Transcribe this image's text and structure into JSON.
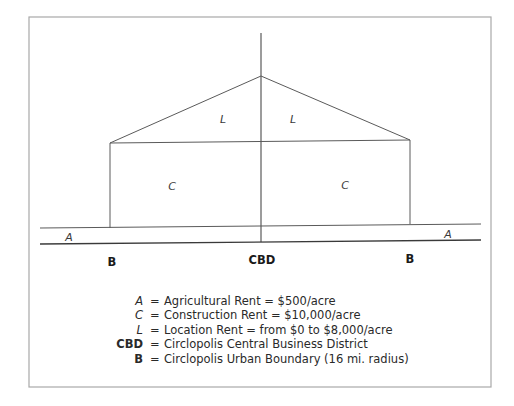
{
  "diagram": {
    "frame": {
      "x1": 29,
      "y1": 17,
      "x2": 491,
      "y2": 387,
      "color": "#a8a8a8"
    },
    "line_color": "#5a5a5a",
    "axis": {
      "x": 261,
      "top": 33,
      "bottom": 242
    },
    "peak": {
      "x": 261,
      "y": 76
    },
    "roof_left": {
      "x": 110,
      "y": 143
    },
    "roof_right": {
      "x": 410,
      "y": 140
    },
    "boundary_left_x": 110,
    "boundary_right_x": 410,
    "upper_baseline": {
      "x1": 40,
      "y1": 228,
      "x2": 481,
      "y2": 224
    },
    "lower_baseline": {
      "x1": 40,
      "y1": 244,
      "x2": 481,
      "y2": 240
    },
    "region_labels": [
      {
        "id": "L-left",
        "text": "L",
        "x": 223,
        "y": 123,
        "italic": true
      },
      {
        "id": "L-right",
        "text": "L",
        "x": 293,
        "y": 123,
        "italic": true
      },
      {
        "id": "C-left",
        "text": "C",
        "x": 172,
        "y": 190,
        "italic": true
      },
      {
        "id": "C-right",
        "text": "C",
        "x": 345,
        "y": 189,
        "italic": true
      },
      {
        "id": "A-left",
        "text": "A",
        "x": 69,
        "y": 241,
        "italic": true
      },
      {
        "id": "A-right",
        "text": "A",
        "x": 448,
        "y": 238,
        "italic": true
      }
    ],
    "axis_labels": [
      {
        "id": "B-left",
        "text": "B",
        "x": 112,
        "y": 266,
        "bold": true
      },
      {
        "id": "CBD",
        "text": "CBD",
        "x": 262,
        "y": 264,
        "bold": true
      },
      {
        "id": "B-right",
        "text": "B",
        "x": 410,
        "y": 263,
        "bold": true
      }
    ]
  },
  "legend": {
    "key_right_x": 143,
    "eq_x": 150,
    "text_x": 164,
    "rows": [
      {
        "key": "A",
        "style": "italic",
        "eq": "=",
        "text": "Agricultural Rent = $500/acre",
        "y": 294
      },
      {
        "key": "C",
        "style": "italic",
        "eq": "=",
        "text": "Construction Rent = $10,000/acre",
        "y": 308
      },
      {
        "key": "L",
        "style": "italic",
        "eq": "=",
        "text": "Location Rent = from $0 to $8,000/acre",
        "y": 323
      },
      {
        "key": "CBD",
        "style": "bold",
        "eq": "=",
        "text": "Circlopolis Central Business District",
        "y": 337
      },
      {
        "key": "B",
        "style": "bold",
        "eq": "=",
        "text": "Circlopolis Urban Boundary (16 mi. radius)",
        "y": 352
      }
    ]
  }
}
